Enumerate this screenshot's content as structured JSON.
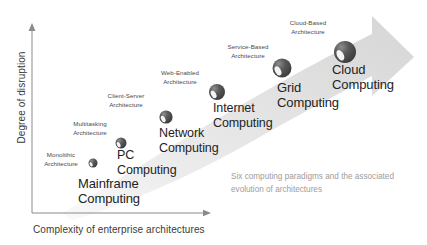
{
  "figure": {
    "caption": "Six computing paradigms and the\nassociated evolution of architectures",
    "axes": {
      "y_label": "Degree of disruption",
      "x_label": "Complexity of enterprise architectures"
    },
    "colors": {
      "arrow_light": "#f0f0f0",
      "arrow_mid": "#dcdcdc",
      "arrow_dark": "#cfcfcf",
      "sphere_dark": "#4a4a4a",
      "sphere_light": "#ffffff",
      "text_primary": "#232323",
      "text_secondary": "#4a4a4a",
      "caption_gray": "#9d9d9d",
      "axis_gray": "#8a8a8a"
    }
  },
  "stages": [
    {
      "id": "monolithic",
      "architecture": "Monolithic\nArchitecture",
      "paradigm": "Mainframe\nComputing",
      "arch_x": 33,
      "arch_y": 151,
      "arch_w": 56,
      "node_x": 93,
      "node_y": 163,
      "node_r": 4.5,
      "paradigm_x": 78,
      "paradigm_y": 176,
      "paradigm_size": 13
    },
    {
      "id": "multitasking",
      "architecture": "Multitasking\nArchitecture",
      "paradigm": "PC\nComputing",
      "arch_x": 61,
      "arch_y": 120,
      "arch_w": 58,
      "node_x": 121,
      "node_y": 143,
      "node_r": 5.5,
      "paradigm_x": 117,
      "paradigm_y": 148,
      "paradigm_size": 12.5
    },
    {
      "id": "client-server",
      "architecture": "Client-Server\nArchitecture",
      "paradigm": "Network\nComputing",
      "arch_x": 96,
      "arch_y": 92,
      "arch_w": 60,
      "node_x": 166,
      "node_y": 117,
      "node_r": 6.6,
      "paradigm_x": 159,
      "paradigm_y": 126,
      "paradigm_size": 12.5
    },
    {
      "id": "web-enabled",
      "architecture": "Web-Enabled\nArchitecture",
      "paradigm": "Internet\nComputing",
      "arch_x": 149,
      "arch_y": 69,
      "arch_w": 62,
      "node_x": 217,
      "node_y": 92,
      "node_r": 8,
      "paradigm_x": 213,
      "paradigm_y": 101,
      "paradigm_size": 12.5
    },
    {
      "id": "service-based",
      "architecture": "Service-Based\nArchitecture",
      "paradigm": "Grid\nComputing",
      "arch_x": 217,
      "arch_y": 43,
      "arch_w": 62,
      "node_x": 282,
      "node_y": 68,
      "node_r": 9.5,
      "paradigm_x": 277,
      "paradigm_y": 80,
      "paradigm_size": 13
    },
    {
      "id": "cloud-based",
      "architecture": "Cloud-Based\nArchitecture",
      "paradigm": "Cloud\nComputing",
      "arch_x": 277,
      "arch_y": 19,
      "arch_w": 62,
      "node_x": 345,
      "node_y": 52,
      "node_r": 11,
      "paradigm_x": 332,
      "paradigm_y": 62,
      "paradigm_size": 13
    }
  ]
}
